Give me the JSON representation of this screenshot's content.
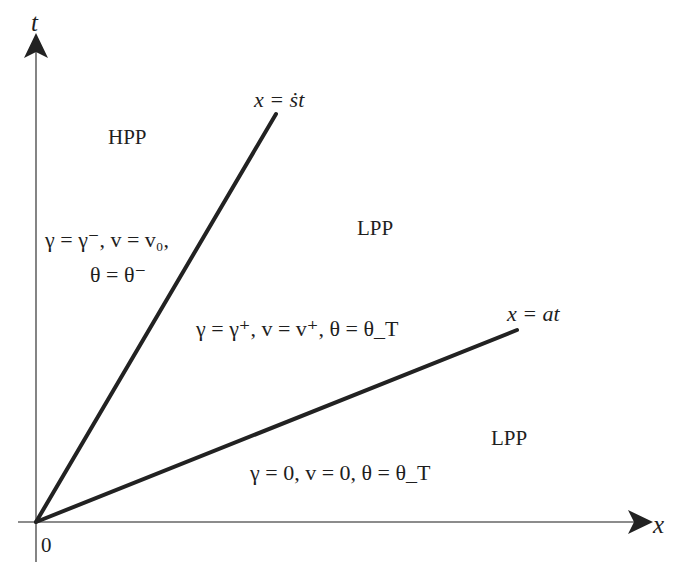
{
  "diagram": {
    "axes": {
      "vertical_label": "t",
      "horizontal_label": "x",
      "origin_label": "0"
    },
    "lines": [
      {
        "label": "x = ṡt",
        "end": [
          276,
          114
        ]
      },
      {
        "label": "x = at",
        "end": [
          517,
          330
        ]
      }
    ],
    "regions": [
      {
        "name": "HPP",
        "conditions_line1": "γ = γ⁻,  v = v₀,",
        "conditions_line2": "θ = θ⁻"
      },
      {
        "name": "LPP",
        "conditions_line1": "γ = γ⁺,  v = v⁺,  θ = θ_T"
      },
      {
        "name": "LPP",
        "conditions_line1": "γ = 0,  v = 0,  θ = θ_T"
      }
    ],
    "colors": {
      "line": "#222222",
      "axis": "#555555",
      "text": "#1e1e1e"
    }
  }
}
